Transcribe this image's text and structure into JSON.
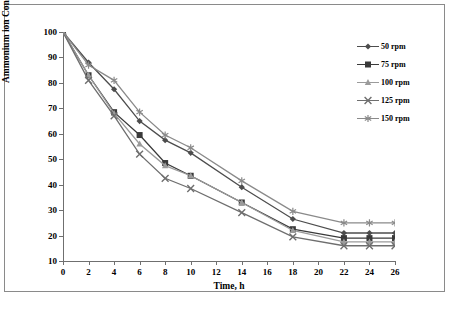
{
  "chart_data": {
    "type": "line",
    "title": "",
    "xlabel": "Time, h",
    "ylabel": "Ammonium ion Conc., ppm",
    "xlim": [
      0,
      26
    ],
    "ylim": [
      10,
      100
    ],
    "xticks": [
      0,
      2,
      4,
      6,
      8,
      10,
      12,
      14,
      16,
      18,
      20,
      22,
      24,
      26
    ],
    "yticks": [
      10,
      20,
      30,
      40,
      50,
      60,
      70,
      80,
      90,
      100
    ],
    "grid": false,
    "legend_position": "right",
    "x": [
      0,
      2,
      4,
      6,
      8,
      10,
      14,
      18,
      22,
      24,
      26
    ],
    "series": [
      {
        "name": "50 rpm",
        "marker": "diamond",
        "color": "#4d4d4d",
        "values": [
          100,
          88,
          77.5,
          65,
          57.5,
          52.5,
          39,
          26.5,
          21,
          21,
          21
        ]
      },
      {
        "name": "75 rpm",
        "marker": "square",
        "color": "#3a3a3a",
        "values": [
          100,
          83,
          68.5,
          59.5,
          48.5,
          43.5,
          33,
          22.5,
          19,
          19,
          19
        ]
      },
      {
        "name": "100 rpm",
        "marker": "triangle",
        "color": "#9b9b9b",
        "values": [
          100,
          83,
          68,
          56,
          47.5,
          43.5,
          33,
          22,
          17.5,
          17.5,
          17.5
        ]
      },
      {
        "name": "125 rpm",
        "marker": "cross",
        "color": "#6e6e6e",
        "values": [
          100,
          81,
          67,
          52,
          42.5,
          38.5,
          29,
          19.5,
          16,
          16,
          16
        ]
      },
      {
        "name": "150 rpm",
        "marker": "asterisk",
        "color": "#8a8a8a",
        "values": [
          100,
          87,
          81,
          68.5,
          59.5,
          54.5,
          41.5,
          29.5,
          25,
          25,
          25
        ]
      }
    ]
  },
  "legend": {
    "items": [
      {
        "label": "50 rpm"
      },
      {
        "label": "75 rpm"
      },
      {
        "label": "100 rpm"
      },
      {
        "label": "125 rpm"
      },
      {
        "label": "150 rpm"
      }
    ]
  },
  "colors": {
    "axis": "#6f6f6f",
    "frame": "#8a8a8a",
    "text": "#000000",
    "background": "#ffffff"
  }
}
